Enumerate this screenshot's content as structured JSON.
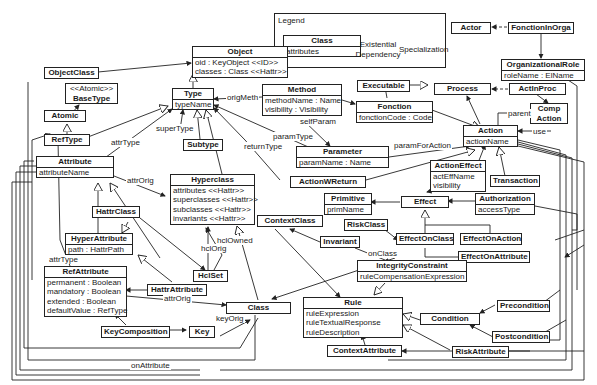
{
  "legend": {
    "title": "Legend",
    "class_name": "Class",
    "class_attrs": "attributes",
    "existential": "Existential Dependency",
    "specialization": "Specialization"
  },
  "classes": {
    "object": {
      "name": "Object",
      "attrs": [
        "oid : KeyObject <<ID>>",
        "classes : Class <<Hattr>>"
      ]
    },
    "objectclass": {
      "name": "ObjectClass"
    },
    "basetype": {
      "stereotype": "<<Atomic>>",
      "name": "BaseType"
    },
    "atomic": {
      "name": "Atomic"
    },
    "reftype": {
      "name": "RefType"
    },
    "type": {
      "name": "Type",
      "attrs": [
        "typeName"
      ]
    },
    "subtype": {
      "name": "Subtype"
    },
    "method": {
      "name": "Method",
      "attrs": [
        "methodName : Name",
        "visibility : Visibility"
      ]
    },
    "executable": {
      "name": "Executable"
    },
    "fonction": {
      "name": "Fonction",
      "attrs": [
        "fonctionCode : Code"
      ]
    },
    "process": {
      "name": "Process"
    },
    "actor": {
      "name": "Actor"
    },
    "fonctioninorga": {
      "name": "FonctionInOrga"
    },
    "organizationalrole": {
      "name": "OrganizationalRole",
      "attrs": [
        "roleName : ElName"
      ]
    },
    "actinproc": {
      "name": "ActInProc"
    },
    "compaction": {
      "name": "Comp Action"
    },
    "action": {
      "name": "Action",
      "attrs": [
        "actionName"
      ]
    },
    "parameter": {
      "name": "Parameter",
      "attrs": [
        "paramName : Name"
      ]
    },
    "attribute": {
      "name": "Attribute",
      "attrs": [
        "attributeName"
      ]
    },
    "hyperclass": {
      "name": "Hyperclass",
      "attrs": [
        "attributes <<Hattr>>",
        "superclasses <<Hattr>>",
        "subclasses <<Hattr>>",
        "invariants <<Hattr>>"
      ]
    },
    "actionwreturn": {
      "name": "ActionWReturn"
    },
    "actioneffect": {
      "name": "ActionEffect",
      "attrs": [
        "actEffName",
        "visibility"
      ]
    },
    "transaction": {
      "name": "Transaction"
    },
    "primitive": {
      "name": "Primitive",
      "attrs": [
        "primName"
      ]
    },
    "effect": {
      "name": "Effect"
    },
    "authorization": {
      "name": "Authorization",
      "attrs": [
        "accessType"
      ]
    },
    "hattrclass": {
      "name": "HattrClass"
    },
    "contextclass": {
      "name": "ContextClass"
    },
    "riskclass": {
      "name": "RiskClass"
    },
    "hyperattribute": {
      "name": "HyperAttribute",
      "attrs": [
        "path : HattrPath"
      ]
    },
    "invariant": {
      "name": "Invariant"
    },
    "effectonclass": {
      "name": "EffectOnClass"
    },
    "effectonaction": {
      "name": "EffectOnAction"
    },
    "hclset": {
      "name": "HclSet"
    },
    "effectonattribute": {
      "name": "EffectOnAttribute"
    },
    "integrityconstraint": {
      "name": "IntegrityConstraint",
      "attrs": [
        "ruleCompensationExpression"
      ]
    },
    "refattribute": {
      "name": "RefAttribute",
      "attrs": [
        "permanent : Boolean",
        "mandatory : Boolean",
        "extended : Boolean",
        "defaultValue : RefType"
      ]
    },
    "hattrattribute": {
      "name": "HattrAttribute"
    },
    "class": {
      "name": "Class"
    },
    "rule": {
      "name": "Rule",
      "attrs": [
        "ruleExpression",
        "ruleTextualResponse",
        "ruleDescription"
      ]
    },
    "precondition": {
      "name": "Precondition"
    },
    "condition": {
      "name": "Condition"
    },
    "postcondition": {
      "name": "Postcondition"
    },
    "keycomposition": {
      "name": "KeyComposition"
    },
    "key": {
      "name": "Key"
    },
    "riskattribute": {
      "name": "RiskAttribute"
    },
    "contextattribute": {
      "name": "ContextAttribute"
    }
  },
  "labels": {
    "origMeth": "origMeth",
    "superType": "superType",
    "attrType1": "attrType",
    "attrType2": "attrType",
    "selfParam": "selfParam",
    "paramType": "paramType",
    "returnType": "returnType",
    "paramForAction": "paramForAction",
    "parent": "parent",
    "use": "use",
    "attrOrig1": "attrOrig",
    "attrOrig2": "attrOrig",
    "hclOrig": "hclOrig",
    "hclOwned": "hclOwned",
    "onClass": "onClass",
    "keyOrig": "keyOrig",
    "onAttribute": "onAttribute"
  }
}
